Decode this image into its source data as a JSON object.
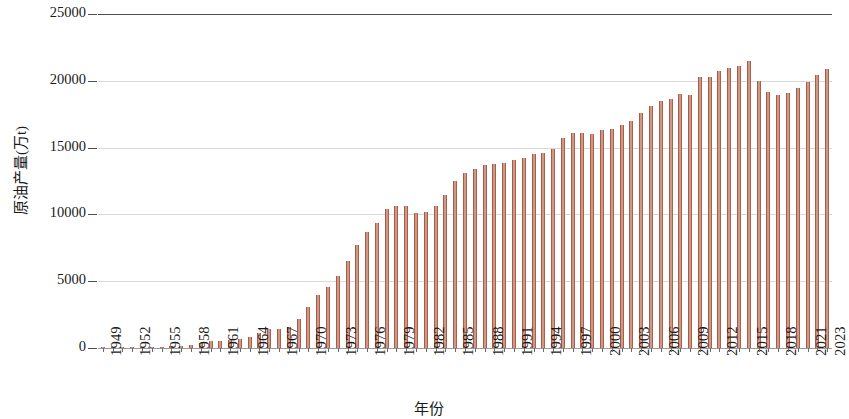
{
  "chart_data": {
    "type": "bar",
    "title": "",
    "xlabel": "年份",
    "ylabel": "原油产量(万t)",
    "ylim": [
      0,
      25000
    ],
    "ytick_labels": [
      "0",
      "5000",
      "10000",
      "15000",
      "20000",
      "25000"
    ],
    "ytick_values": [
      0,
      5000,
      10000,
      15000,
      20000,
      25000
    ],
    "grid": true,
    "legend": null,
    "bar_color": "#a8604a",
    "bar_edge_color": "#94513e",
    "gridline_color": "#d9d9d9",
    "axis_color": "#4d4d4d",
    "xtick_label_rotation": -90,
    "xtick_labels": [
      "1949",
      "1952",
      "1955",
      "1958",
      "1961",
      "1964",
      "1967",
      "1970",
      "1973",
      "1976",
      "1979",
      "1982",
      "1985",
      "1988",
      "1991",
      "1994",
      "1997",
      "2000",
      "2003",
      "2006",
      "2009",
      "2012",
      "2015",
      "2018",
      "2021",
      "2023"
    ],
    "categories": [
      "1949",
      "1950",
      "1951",
      "1952",
      "1953",
      "1954",
      "1955",
      "1956",
      "1957",
      "1958",
      "1959",
      "1960",
      "1961",
      "1962",
      "1963",
      "1964",
      "1965",
      "1966",
      "1967",
      "1968",
      "1969",
      "1970",
      "1971",
      "1972",
      "1973",
      "1974",
      "1975",
      "1976",
      "1977",
      "1978",
      "1979",
      "1980",
      "1981",
      "1982",
      "1983",
      "1984",
      "1985",
      "1986",
      "1987",
      "1988",
      "1989",
      "1990",
      "1991",
      "1992",
      "1993",
      "1994",
      "1995",
      "1996",
      "1997",
      "1998",
      "1999",
      "2000",
      "2001",
      "2002",
      "2003",
      "2004",
      "2005",
      "2006",
      "2007",
      "2008",
      "2009",
      "2010",
      "2011",
      "2012",
      "2013",
      "2014",
      "2015",
      "2016",
      "2017",
      "2018",
      "2019",
      "2020",
      "2021",
      "2022",
      "2023"
    ],
    "values": [
      12,
      20,
      31,
      44,
      62,
      79,
      97,
      116,
      146,
      226,
      373,
      520,
      531,
      575,
      648,
      848,
      1131,
      1455,
      1388,
      1599,
      2175,
      3065,
      3941,
      4567,
      5361,
      6485,
      7706,
      8716,
      9364,
      10405,
      10615,
      10595,
      10122,
      10212,
      10607,
      11461,
      12490,
      13069,
      13414,
      13705,
      13764,
      13831,
      14099,
      14210,
      14524,
      14608,
      14900,
      15733,
      16074,
      16100,
      16000,
      16300,
      16396,
      16700,
      16960,
      17587,
      18135,
      18477,
      18632,
      19043,
      18949,
      20301,
      20288,
      20748,
      20992,
      21143,
      21456,
      19969,
      19151,
      18911,
      19101,
      19477,
      19888,
      20472,
      20891
    ]
  }
}
